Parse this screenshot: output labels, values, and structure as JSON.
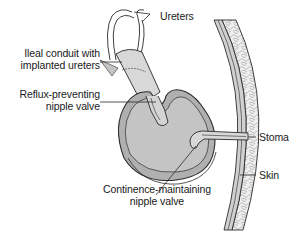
{
  "diagram": {
    "colors": {
      "pouch_fill": "#b8b8b8",
      "pouch_inner": "#c6c6c6",
      "conduit_fill": "#d8d8d8",
      "skin_fill": "#e9e9e9",
      "line": "#2a2a2a",
      "background": "#ffffff"
    },
    "labels": {
      "ureters": "Ureters",
      "ileal_conduit": {
        "line1": "Ileal conduit with",
        "line2": "implanted ureters"
      },
      "reflux_valve": {
        "line1": "Reflux-preventing",
        "line2": "nipple valve"
      },
      "stoma": "Stoma",
      "skin": "Skin",
      "continence_valve": {
        "line1": "Continence-maintaining",
        "line2": "nipple valve"
      }
    }
  }
}
